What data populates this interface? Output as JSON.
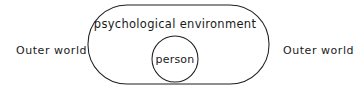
{
  "diagram": {
    "background_color": "#ffffff",
    "stroke_color": "#1f1f1f",
    "text_color": "#1a1a1a",
    "labels": {
      "outer_world_left": "Outer world",
      "outer_world_right": "Outer world",
      "psychological_environment": "psychological  environment",
      "person": "person"
    },
    "shapes": {
      "boundary": {
        "name": "psychological-environment-boundary",
        "type": "stadium",
        "x": 88,
        "y": 5,
        "width": 181,
        "height": 79,
        "radius": 39
      },
      "person_circle": {
        "name": "person-circle",
        "type": "circle",
        "cx": 175,
        "cy": 59,
        "r": 23
      }
    },
    "text_positions": {
      "outer_world_left": {
        "x": 16,
        "y": 54
      },
      "outer_world_right": {
        "x": 283,
        "y": 54
      },
      "psychological_environment": {
        "x": 175,
        "y": 28
      },
      "person": {
        "x": 175,
        "y": 63
      }
    }
  }
}
